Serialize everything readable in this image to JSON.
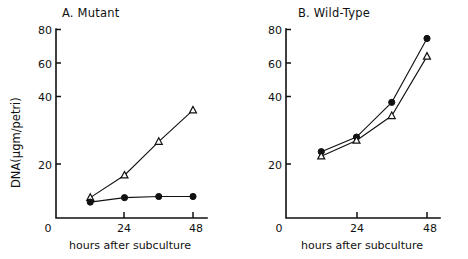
{
  "figure": {
    "background": "#ffffff",
    "ink_color": "#111111",
    "xlabel": "hours after subculture",
    "ylabel": "DNA(μgm/petri)"
  },
  "chart_data": [
    {
      "type": "line",
      "title": "A. Mutant",
      "xlabel": "hours after subculture",
      "ylabel": "DNA(μgm/petri)",
      "x": [
        12,
        24,
        36,
        48
      ],
      "xlim": [
        0,
        50
      ],
      "ylim": [
        0,
        84
      ],
      "xticks": [
        0,
        24,
        48
      ],
      "xtick_labels": [
        "0",
        "24",
        "48"
      ],
      "yticks": [
        20,
        40,
        60,
        80
      ],
      "ytick_labels": [
        "20",
        "40",
        "60",
        "80"
      ],
      "grid": false,
      "legend": "none",
      "series": [
        {
          "name": "open-triangle",
          "marker": "open-triangle",
          "values": [
            5,
            15,
            30,
            44
          ]
        },
        {
          "name": "filled-circle",
          "marker": "filled-circle",
          "values": [
            3,
            5,
            5.5,
            5.5
          ]
        }
      ]
    },
    {
      "type": "line",
      "title": "B. Wild-Type",
      "xlabel": "hours after subculture",
      "ylabel": "DNA(μgm/petri)",
      "x": [
        12,
        24,
        36,
        48
      ],
      "xlim": [
        0,
        50
      ],
      "ylim": [
        0,
        84
      ],
      "xticks": [
        0,
        24,
        48
      ],
      "xtick_labels": [
        "0",
        "24",
        "48"
      ],
      "yticks": [
        20,
        40,
        60,
        80
      ],
      "ytick_labels": [
        "20",
        "40",
        "60",
        "80"
      ],
      "grid": false,
      "legend": "none",
      "series": [
        {
          "name": "filled-circle",
          "marker": "filled-circle",
          "values": [
            25.5,
            32,
            47.5,
            76
          ]
        },
        {
          "name": "open-triangle",
          "marker": "open-triangle",
          "values": [
            23.5,
            30.5,
            41.5,
            68
          ]
        }
      ]
    }
  ]
}
